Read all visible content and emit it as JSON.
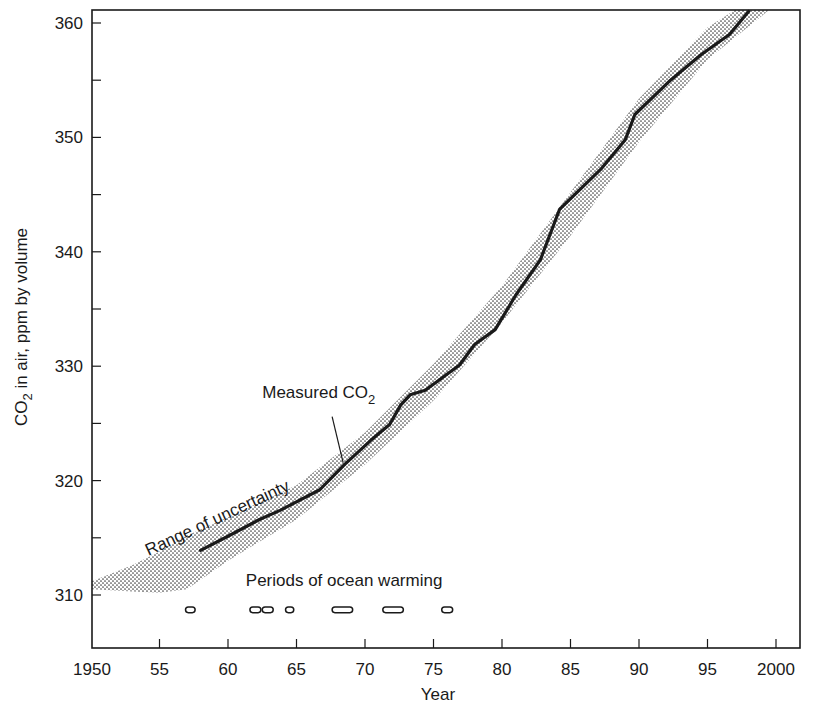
{
  "chart_data": {
    "type": "line",
    "title": "",
    "xlabel": "Year",
    "ylabel": "CO2 in air, ppm by volume",
    "ylabel_parts": {
      "pre": "CO",
      "sub": "2",
      "post": " in air, ppm by volume"
    },
    "xlim": [
      1950,
      2001.8
    ],
    "ylim": [
      305.4,
      361.2
    ],
    "grid": false,
    "x_ticks": [
      1950,
      1955,
      1960,
      1965,
      1970,
      1975,
      1980,
      1985,
      1990,
      1995,
      2000
    ],
    "x_tick_labels": [
      "1950",
      "55",
      "60",
      "65",
      "70",
      "75",
      "80",
      "85",
      "90",
      "95",
      "2000"
    ],
    "y_ticks": [
      310,
      320,
      330,
      340,
      350,
      360
    ],
    "y_tick_labels": [
      "310",
      "320",
      "330",
      "340",
      "350",
      "360"
    ],
    "y_minor_ticks": [
      315,
      325,
      335,
      345,
      355
    ],
    "series": [
      {
        "name": "Measured CO2",
        "style": "solid-thick",
        "color": "#1a1a1a",
        "x": [
          1958.0,
          1960.1,
          1962.3,
          1963.8,
          1966.7,
          1968.5,
          1970.4,
          1971.8,
          1972.6,
          1973.3,
          1974.4,
          1976.9,
          1978.0,
          1979.5,
          1981.0,
          1982.8,
          1984.2,
          1987.2,
          1989.0,
          1989.7,
          1992.3,
          1994.5,
          1996.6,
          1998.0
        ],
        "y": [
          313.9,
          315.2,
          316.6,
          317.4,
          319.2,
          321.4,
          323.5,
          324.9,
          326.6,
          327.5,
          327.9,
          330.1,
          331.9,
          333.2,
          336.2,
          339.3,
          343.7,
          347.2,
          349.8,
          352.0,
          355.0,
          357.2,
          359.0,
          361.0
        ]
      }
    ],
    "bands": [
      {
        "name": "Range of uncertainty",
        "fill": "stippled",
        "color": "#555555",
        "upper": {
          "x": [
            1950.0,
            1953.0,
            1955.0,
            1957.0,
            1960.0,
            1965.0,
            1970.0,
            1975.0,
            1980.0,
            1985.0,
            1990.0,
            1995.0,
            1997.0
          ],
          "y": [
            311.2,
            312.6,
            313.8,
            315.2,
            316.8,
            319.6,
            324.2,
            330.2,
            337.0,
            345.2,
            353.4,
            359.6,
            361.2
          ]
        },
        "lower": {
          "x": [
            1950.0,
            1953.0,
            1955.0,
            1957.0,
            1960.0,
            1965.0,
            1970.0,
            1975.0,
            1980.0,
            1985.0,
            1990.0,
            1995.0,
            1999.5
          ],
          "y": [
            310.5,
            310.3,
            310.2,
            310.5,
            313.0,
            316.6,
            321.4,
            327.0,
            333.8,
            341.4,
            349.6,
            356.8,
            361.2
          ]
        }
      }
    ],
    "warming_periods": [
      {
        "start": 1956.9,
        "end": 1957.6
      },
      {
        "start": 1961.6,
        "end": 1962.4
      },
      {
        "start": 1962.5,
        "end": 1963.3
      },
      {
        "start": 1964.2,
        "end": 1964.8
      },
      {
        "start": 1967.6,
        "end": 1969.1
      },
      {
        "start": 1971.3,
        "end": 1972.8
      },
      {
        "start": 1975.6,
        "end": 1976.4
      }
    ],
    "warming_row_y": 308.7,
    "annotations": [
      {
        "id": "measured",
        "text_pre": "Measured CO",
        "text_sub": "2",
        "x": 1962.5,
        "y": 327.2,
        "pointer_to": {
          "x": 1968.4,
          "y": 321.6
        },
        "pointer_from": {
          "x": 1967.6,
          "y": 325.6
        }
      },
      {
        "id": "range",
        "text": "Range of uncertainty",
        "x": 1954.2,
        "y": 313.4,
        "rotation": -25
      },
      {
        "id": "warming",
        "text": "Periods of ocean warming",
        "x": 1961.3,
        "y": 310.8
      }
    ]
  }
}
